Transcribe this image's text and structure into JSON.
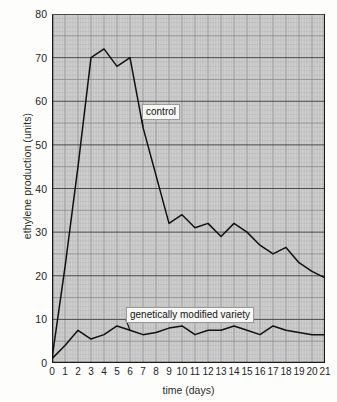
{
  "chart_data": {
    "type": "line",
    "title": "",
    "xlabel": "time (days)",
    "ylabel": "ethylene production (units)",
    "xlim": [
      0,
      21
    ],
    "ylim": [
      0,
      80
    ],
    "ytick_values": [
      0,
      10,
      20,
      30,
      40,
      50,
      60,
      70,
      80
    ],
    "ytick_labels": [
      "0",
      "10",
      "20",
      "30",
      "40",
      "50",
      "60",
      "70",
      "80"
    ],
    "xtick_values": [
      0,
      1,
      2,
      3,
      4,
      5,
      6,
      7,
      8,
      9,
      10,
      11,
      12,
      13,
      14,
      15,
      16,
      17,
      18,
      19,
      20,
      21
    ],
    "xtick_labels": [
      "0",
      "1",
      "2",
      "3",
      "4",
      "5",
      "6",
      "7",
      "8",
      "9",
      "10",
      "11",
      "12",
      "13",
      "14",
      "15",
      "16",
      "17",
      "18",
      "19",
      "20",
      "21"
    ],
    "grid": true,
    "grid_style": "graph-paper, minor gridlines every 0.2 days and 1 unit, major every 1 day and 5 units, bold every 10 units",
    "legend_position": "inline-annotations",
    "x": [
      0,
      1,
      2,
      3,
      4,
      5,
      6,
      7,
      8,
      9,
      10,
      11,
      12,
      13,
      14,
      15,
      16,
      17,
      18,
      19,
      20,
      21
    ],
    "series": [
      {
        "name": "control",
        "label": "control",
        "color": "#111111",
        "values": [
          1,
          22,
          45,
          70,
          72,
          68,
          70,
          54,
          43,
          32,
          34,
          31,
          32,
          29,
          32,
          30,
          27,
          25,
          26.5,
          23,
          21,
          19.5
        ]
      },
      {
        "name": "genetically modified variety",
        "label": "genetically modified variety",
        "color": "#111111",
        "values": [
          1,
          4,
          7.5,
          5.5,
          6.5,
          8.5,
          7.5,
          6.5,
          7,
          8,
          8.5,
          6.5,
          7.5,
          7.5,
          8.5,
          7.5,
          6.5,
          8.5,
          7.5,
          7,
          6.5,
          6.5
        ]
      }
    ],
    "annotations": [
      {
        "text": "control",
        "points_to_series": "control",
        "points_to_x": 7
      },
      {
        "text": "genetically modified variety",
        "points_to_series": "genetically modified variety",
        "points_to_x": 6
      }
    ]
  },
  "colors": {
    "plot_background": "#cfcfcf",
    "grid_minor": "#b0b0b0",
    "grid_major": "#8d8d8d",
    "grid_bold": "#4a4a4a",
    "axis": "#1a1a1a",
    "line": "#111111",
    "label_background": "#f7f7f5",
    "page_background": "#fdfdfc"
  }
}
